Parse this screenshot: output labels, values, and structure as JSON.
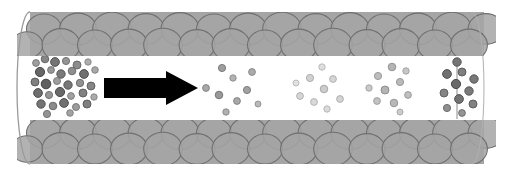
{
  "figure": {
    "title": "Cylindrical tube with particle flow",
    "background_color": "#ffffff",
    "width": 510,
    "height": 175
  },
  "tube": {
    "label": "tube-body",
    "left_edge_x": 30,
    "right_edge_x": 484,
    "top_y": 12,
    "bottom_y": 164,
    "wall_fill_color": "#a8a8a8",
    "wall_stroke_color": "#6e6e6e",
    "lumen_color": "#ffffff",
    "lumen_top_y": 56,
    "lumen_bottom_y": 120,
    "outline_color": "#9a9a9a",
    "end_cap": {
      "label": "left-open-end",
      "shape": "ellipse",
      "rx": 13,
      "cy": 88
    },
    "right_cap": {
      "label": "right-rounded-end",
      "shape": "ellipse",
      "rx": 12,
      "cy": 88
    }
  },
  "wall_cells": {
    "label": "wall-cell-circles",
    "rows": 2,
    "columns": 13,
    "cell_radius": 15,
    "fill_color": "#a5a5a5",
    "stroke_color": "#707070",
    "top_row_cy": [
      29,
      45
    ],
    "bottom_row_cy": [
      133,
      149
    ],
    "start_x": 44,
    "spacing_x": 34
  },
  "arrow": {
    "label": "flow-direction-arrow",
    "color": "#000000",
    "direction": "right",
    "shaft_x": 104,
    "shaft_y": 78,
    "shaft_width": 62,
    "shaft_height": 20,
    "head_x": 166,
    "head_width": 32,
    "head_half_height": 17,
    "center_y": 88
  },
  "membrane_line": {
    "label": "right-membrane-line",
    "x": 457,
    "y_top": 58,
    "y_bottom": 119,
    "color": "#8c8c8c",
    "width": 1
  },
  "particle_clusters": [
    {
      "name": "cluster-source-dense",
      "position": "left-end",
      "concentration": "high",
      "color": "#6a6a6a",
      "edge_color": "#4d4d4d",
      "count": 31,
      "radius_range": [
        3.2,
        5.2
      ],
      "particles": [
        {
          "x": 36,
          "y": 63,
          "r": 3.4,
          "shade": 0.62
        },
        {
          "x": 45,
          "y": 59,
          "r": 3.8,
          "shade": 0.52
        },
        {
          "x": 55,
          "y": 62,
          "r": 4.4,
          "shade": 0.46
        },
        {
          "x": 66,
          "y": 61,
          "r": 3.6,
          "shade": 0.58
        },
        {
          "x": 77,
          "y": 65,
          "r": 4.0,
          "shade": 0.55
        },
        {
          "x": 88,
          "y": 62,
          "r": 3.2,
          "shade": 0.68
        },
        {
          "x": 40,
          "y": 72,
          "r": 4.6,
          "shade": 0.4
        },
        {
          "x": 51,
          "y": 70,
          "r": 3.4,
          "shade": 0.6
        },
        {
          "x": 61,
          "y": 74,
          "r": 4.2,
          "shade": 0.48
        },
        {
          "x": 72,
          "y": 71,
          "r": 3.8,
          "shade": 0.56
        },
        {
          "x": 84,
          "y": 74,
          "r": 4.4,
          "shade": 0.44
        },
        {
          "x": 95,
          "y": 70,
          "r": 3.3,
          "shade": 0.66
        },
        {
          "x": 35,
          "y": 82,
          "r": 4.0,
          "shade": 0.5
        },
        {
          "x": 46,
          "y": 84,
          "r": 4.8,
          "shade": 0.38
        },
        {
          "x": 57,
          "y": 81,
          "r": 3.5,
          "shade": 0.62
        },
        {
          "x": 68,
          "y": 85,
          "r": 4.2,
          "shade": 0.47
        },
        {
          "x": 80,
          "y": 83,
          "r": 3.7,
          "shade": 0.57
        },
        {
          "x": 91,
          "y": 86,
          "r": 4.0,
          "shade": 0.52
        },
        {
          "x": 38,
          "y": 93,
          "r": 4.4,
          "shade": 0.43
        },
        {
          "x": 49,
          "y": 95,
          "r": 3.6,
          "shade": 0.59
        },
        {
          "x": 60,
          "y": 92,
          "r": 4.6,
          "shade": 0.41
        },
        {
          "x": 71,
          "y": 96,
          "r": 3.4,
          "shade": 0.63
        },
        {
          "x": 83,
          "y": 93,
          "r": 4.0,
          "shade": 0.51
        },
        {
          "x": 94,
          "y": 97,
          "r": 3.2,
          "shade": 0.67
        },
        {
          "x": 41,
          "y": 104,
          "r": 4.2,
          "shade": 0.46
        },
        {
          "x": 53,
          "y": 106,
          "r": 3.8,
          "shade": 0.55
        },
        {
          "x": 64,
          "y": 103,
          "r": 4.4,
          "shade": 0.44
        },
        {
          "x": 76,
          "y": 107,
          "r": 3.5,
          "shade": 0.61
        },
        {
          "x": 87,
          "y": 104,
          "r": 4.0,
          "shade": 0.5
        },
        {
          "x": 47,
          "y": 114,
          "r": 3.6,
          "shade": 0.58
        },
        {
          "x": 70,
          "y": 113,
          "r": 3.3,
          "shade": 0.64
        }
      ]
    },
    {
      "name": "cluster-mid-left",
      "position": "after-arrow",
      "concentration": "medium",
      "color": "#9d9d9d",
      "edge_color": "#7a7a7a",
      "count": 9,
      "radius_range": [
        3.0,
        4.2
      ],
      "particles": [
        {
          "x": 206,
          "y": 88,
          "r": 3.4,
          "shade": 0.66
        },
        {
          "x": 222,
          "y": 68,
          "r": 3.6,
          "shade": 0.62
        },
        {
          "x": 219,
          "y": 95,
          "r": 3.8,
          "shade": 0.6
        },
        {
          "x": 233,
          "y": 78,
          "r": 3.2,
          "shade": 0.7
        },
        {
          "x": 237,
          "y": 101,
          "r": 3.4,
          "shade": 0.66
        },
        {
          "x": 247,
          "y": 90,
          "r": 3.6,
          "shade": 0.63
        },
        {
          "x": 226,
          "y": 112,
          "r": 3.2,
          "shade": 0.69
        },
        {
          "x": 252,
          "y": 72,
          "r": 3.4,
          "shade": 0.67
        },
        {
          "x": 258,
          "y": 104,
          "r": 3.0,
          "shade": 0.72
        }
      ]
    },
    {
      "name": "cluster-mid-right-faint",
      "position": "center-right",
      "concentration": "low",
      "color": "#cfcfcf",
      "edge_color": "#b4b4b4",
      "count": 9,
      "radius_range": [
        3.0,
        4.0
      ],
      "particles": [
        {
          "x": 300,
          "y": 96,
          "r": 3.4,
          "shade": 0.84
        },
        {
          "x": 310,
          "y": 78,
          "r": 3.6,
          "shade": 0.82
        },
        {
          "x": 314,
          "y": 102,
          "r": 3.4,
          "shade": 0.85
        },
        {
          "x": 322,
          "y": 67,
          "r": 3.2,
          "shade": 0.87
        },
        {
          "x": 324,
          "y": 89,
          "r": 3.8,
          "shade": 0.8
        },
        {
          "x": 333,
          "y": 79,
          "r": 3.4,
          "shade": 0.84
        },
        {
          "x": 327,
          "y": 109,
          "r": 3.2,
          "shade": 0.86
        },
        {
          "x": 340,
          "y": 99,
          "r": 3.4,
          "shade": 0.83
        },
        {
          "x": 296,
          "y": 83,
          "r": 3.0,
          "shade": 0.88
        }
      ]
    },
    {
      "name": "cluster-right-gathering",
      "position": "right-of-center",
      "concentration": "medium",
      "color": "#b0b0b0",
      "edge_color": "#909090",
      "count": 10,
      "radius_range": [
        3.2,
        4.4
      ],
      "particles": [
        {
          "x": 378,
          "y": 76,
          "r": 3.6,
          "shade": 0.74
        },
        {
          "x": 392,
          "y": 67,
          "r": 3.8,
          "shade": 0.71
        },
        {
          "x": 385,
          "y": 90,
          "r": 4.0,
          "shade": 0.7
        },
        {
          "x": 400,
          "y": 82,
          "r": 3.6,
          "shade": 0.73
        },
        {
          "x": 377,
          "y": 101,
          "r": 3.4,
          "shade": 0.76
        },
        {
          "x": 394,
          "y": 103,
          "r": 3.8,
          "shade": 0.72
        },
        {
          "x": 408,
          "y": 95,
          "r": 3.4,
          "shade": 0.75
        },
        {
          "x": 406,
          "y": 71,
          "r": 3.2,
          "shade": 0.78
        },
        {
          "x": 369,
          "y": 88,
          "r": 3.2,
          "shade": 0.79
        },
        {
          "x": 400,
          "y": 112,
          "r": 3.0,
          "shade": 0.8
        }
      ]
    },
    {
      "name": "cluster-right-end-dense",
      "position": "right-end-at-membrane",
      "concentration": "high",
      "color": "#6f6f6f",
      "edge_color": "#525252",
      "count": 11,
      "radius_range": [
        3.4,
        5.0
      ],
      "particles": [
        {
          "x": 457,
          "y": 62,
          "r": 4.2,
          "shade": 0.46
        },
        {
          "x": 447,
          "y": 74,
          "r": 4.4,
          "shade": 0.44
        },
        {
          "x": 462,
          "y": 72,
          "r": 4.0,
          "shade": 0.5
        },
        {
          "x": 474,
          "y": 79,
          "r": 4.2,
          "shade": 0.47
        },
        {
          "x": 456,
          "y": 84,
          "r": 4.6,
          "shade": 0.42
        },
        {
          "x": 469,
          "y": 91,
          "r": 4.2,
          "shade": 0.48
        },
        {
          "x": 444,
          "y": 93,
          "r": 4.0,
          "shade": 0.52
        },
        {
          "x": 459,
          "y": 99,
          "r": 4.4,
          "shade": 0.45
        },
        {
          "x": 473,
          "y": 104,
          "r": 4.0,
          "shade": 0.51
        },
        {
          "x": 447,
          "y": 108,
          "r": 3.6,
          "shade": 0.56
        },
        {
          "x": 462,
          "y": 113,
          "r": 3.4,
          "shade": 0.58
        }
      ]
    }
  ]
}
